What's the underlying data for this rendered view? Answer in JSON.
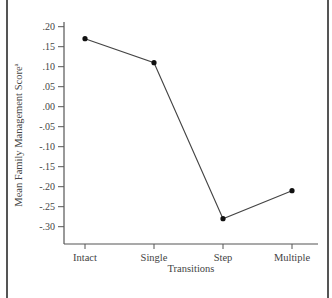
{
  "chart_data": {
    "type": "line",
    "title": "",
    "xlabel": "Transitions",
    "ylabel": "Mean Family Management Score",
    "ylabel_superscript": "a",
    "categories": [
      "Intact",
      "Single",
      "Step",
      "Multiple"
    ],
    "series": [
      {
        "name": "Mean Family Management Score",
        "values": [
          0.17,
          0.11,
          -0.28,
          -0.21
        ]
      }
    ],
    "yticks": [
      ".20",
      ".15",
      ".10",
      ".05",
      ".00",
      "-.05",
      "-.10",
      "-.15",
      "-.20",
      "-.25",
      "-.30"
    ],
    "ylim": [
      -0.34,
      0.2
    ],
    "grid": false,
    "legend": "none",
    "marker": "filled-circle",
    "line_color": "#444444"
  }
}
